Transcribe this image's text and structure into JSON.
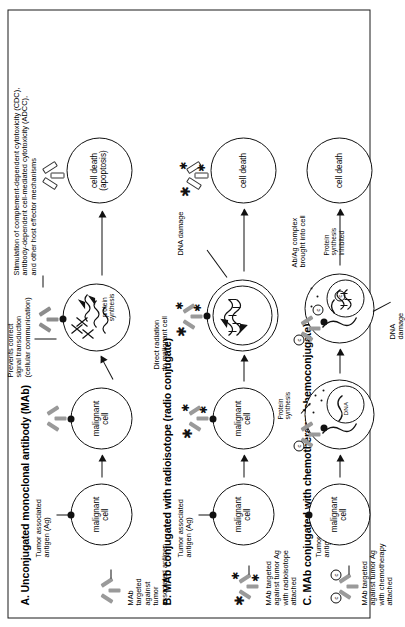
{
  "figure": {
    "orientation": "rotated-90-ccw",
    "sections": [
      {
        "id": "A",
        "title": "A. Unconjugated monoclonal antibody (MAb)",
        "reagent_label": "MAb\ntargeted\nagainst\ntumor\nassociated antigen",
        "antigen_label": "Tumor associated\nantigen (Ag)",
        "cell_label": "malignant\ncell",
        "mechanism_label": "Prevents correct\nsignal transduction\n(cellular communication)",
        "effector_label": "Stimulation of complement-dependent cytotoxicity (CDC),\nantibody-dependent cell-mediated cytotoxicity (ADCC),\nand other host effector mechanisms",
        "intracellular_label": "protein\nsynthesis",
        "outcome_label": "cell death\n(apoptosis)"
      },
      {
        "id": "B",
        "title": "B. MAb conjugated with radioisotope (radio conjugate)",
        "reagent_label": "MAb targeted\nagainst tumor Ag\nwith radioisotope\nattached",
        "antigen_label": "Tumor associated\nantigen (Ag)",
        "cell_label": "malignant\ncell",
        "mechanism_label": "Direct radiation\nto malignant cell",
        "damage_label": "DNA damage",
        "outcome_label": "cell death"
      },
      {
        "id": "C",
        "title": "C. MAb conjugated with chemotherapy (chemoconjugate)",
        "reagent_label": "MAb targeted\nagainst tumor Ag\nwith chemotherapy\nattached",
        "antigen_label": "Tumor associated\nantigen (Ag)",
        "cell_label": "malignant\ncell",
        "internalization_label": "Ab/Ag complex\nbrought into cell",
        "protein_synth_label": "Protein\nsynthesis",
        "protein_inhibited_label": "Protein\nsynthesis\ninhibited",
        "damage_label": "DNA\ndamage",
        "nucleus_label": "DNA",
        "outcome_label": "cell death"
      }
    ],
    "icons": {
      "antibody": "antibody-y-icon",
      "antigen": "antigen-dot-icon",
      "radiation": "radiation-burst-icon",
      "chemo": "chemo-drug-icon"
    },
    "colors": {
      "ink": "#111111",
      "antibody_grey": "#9a9a9a",
      "background": "#ffffff"
    }
  }
}
